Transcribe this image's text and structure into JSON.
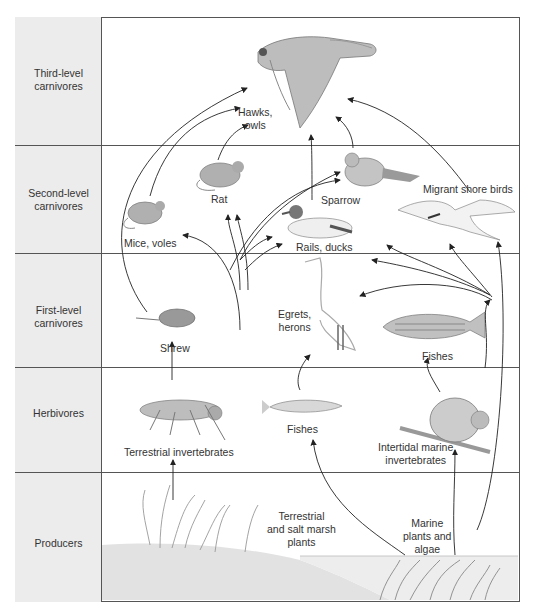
{
  "diagram": {
    "type": "food-web",
    "trophic_levels": [
      {
        "id": "third",
        "label_line1": "Third-level",
        "label_line2": "carnivores"
      },
      {
        "id": "second",
        "label_line1": "Second-level",
        "label_line2": "carnivores"
      },
      {
        "id": "first",
        "label_line1": "First-level",
        "label_line2": "carnivores"
      },
      {
        "id": "herb",
        "label_line1": "Herbivores",
        "label_line2": ""
      },
      {
        "id": "prod",
        "label_line1": "Producers",
        "label_line2": ""
      }
    ],
    "organisms": {
      "hawks": {
        "line1": "Hawks,",
        "line2": "owls",
        "icon": "hawk-icon"
      },
      "mice": {
        "line1": "Mice, voles",
        "icon": "mouse-icon"
      },
      "rat": {
        "line1": "Rat",
        "icon": "rat-icon"
      },
      "sparrow": {
        "line1": "Sparrow",
        "icon": "sparrow-icon"
      },
      "ducks": {
        "line1": "Rails, ducks",
        "icon": "duck-icon"
      },
      "shorebirds": {
        "line1": "Migrant shore birds",
        "icon": "tern-icon"
      },
      "shrew": {
        "line1": "Shrew",
        "icon": "shrew-icon"
      },
      "egrets": {
        "line1": "Egrets,",
        "line2": "herons",
        "icon": "egret-icon"
      },
      "fishes_top": {
        "line1": "Fishes",
        "icon": "striped-bass-icon"
      },
      "terr_inv": {
        "line1": "Terrestrial invertebrates",
        "icon": "grasshopper-icon"
      },
      "fishes_small": {
        "line1": "Fishes",
        "icon": "small-fish-icon"
      },
      "marine_inv": {
        "line1": "Intertidal marine",
        "line2": "invertebrates",
        "icon": "snail-icon"
      },
      "terr_plants": {
        "line1": "Terrestrial",
        "line2": "and salt marsh",
        "line3": "plants",
        "icon": "grass-icon"
      },
      "marine_plants": {
        "line1": "Marine",
        "line2": "plants and",
        "line3": "algae",
        "icon": "seaweed-icon"
      }
    },
    "edges": [
      [
        "shrew",
        "hawks"
      ],
      [
        "mice",
        "hawks"
      ],
      [
        "rat",
        "hawks"
      ],
      [
        "ducks",
        "hawks"
      ],
      [
        "sparrow",
        "hawks"
      ],
      [
        "shorebirds",
        "hawks"
      ],
      [
        "terr_inv",
        "mice"
      ],
      [
        "terr_inv",
        "rat"
      ],
      [
        "terr_inv",
        "sparrow"
      ],
      [
        "terr_inv",
        "ducks"
      ],
      [
        "terr_plants",
        "mice"
      ],
      [
        "terr_plants",
        "rat"
      ],
      [
        "terr_plants",
        "sparrow"
      ],
      [
        "terr_plants",
        "ducks"
      ],
      [
        "terr_inv",
        "shrew"
      ],
      [
        "terr_plants",
        "terr_inv"
      ],
      [
        "marine_inv",
        "sparrow"
      ],
      [
        "marine_inv",
        "ducks"
      ],
      [
        "marine_inv",
        "shorebirds"
      ],
      [
        "marine_inv",
        "egrets"
      ],
      [
        "marine_inv",
        "fishes_top"
      ],
      [
        "marine_plants",
        "shorebirds"
      ],
      [
        "marine_plants",
        "marine_inv"
      ],
      [
        "marine_plants",
        "fishes_small"
      ],
      [
        "fishes_small",
        "egrets"
      ]
    ]
  }
}
